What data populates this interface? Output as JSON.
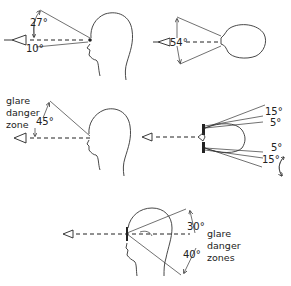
{
  "diagram": {
    "panels": [
      {
        "id": "side-view-vertical",
        "angles": {
          "up": "27°",
          "down": "10°"
        }
      },
      {
        "id": "top-view-horizontal",
        "angles": {
          "total": "54°"
        }
      },
      {
        "id": "side-view-glare",
        "labels": [
          "glare",
          "danger",
          "zone"
        ],
        "angles": {
          "up": "45°"
        }
      },
      {
        "id": "top-view-eyes-spectacles",
        "angles": {
          "upper_outer": "15°",
          "upper_inner": "5°",
          "lower_inner": "5°",
          "lower_outer": "15°"
        }
      },
      {
        "id": "side-view-glare-zones",
        "labels": [
          "glare",
          "danger",
          "zones"
        ],
        "angles": {
          "up": "30°",
          "down": "40°"
        }
      }
    ]
  }
}
